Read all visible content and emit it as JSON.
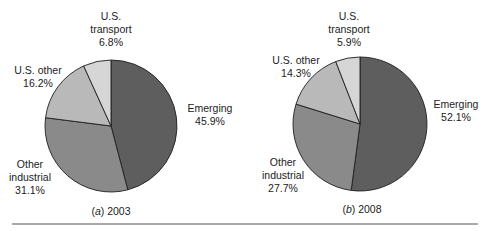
{
  "chart_data": [
    {
      "type": "pie",
      "title": "(a) 2003",
      "caption_prefix": "a",
      "caption_year": "2003",
      "categories": [
        "Emerging",
        "Other industrial",
        "U.S. other",
        "U.S. transport"
      ],
      "values": [
        45.9,
        31.1,
        16.2,
        6.8
      ],
      "labels": [
        "45.9%",
        "31.1%",
        "16.2%",
        "6.8%"
      ],
      "colors": [
        "#5e5e5e",
        "#8a8a8a",
        "#b9b9b9",
        "#d6d6d6"
      ],
      "start_angle": "12 o'clock, clockwise"
    },
    {
      "type": "pie",
      "title": "(b) 2008",
      "caption_prefix": "b",
      "caption_year": "2008",
      "categories": [
        "Emerging",
        "Other industrial",
        "U.S. other",
        "U.S. transport"
      ],
      "values": [
        52.1,
        27.7,
        14.3,
        5.9
      ],
      "labels": [
        "52.1%",
        "27.7%",
        "14.3%",
        "5.9%"
      ],
      "colors": [
        "#5e5e5e",
        "#8a8a8a",
        "#b9b9b9",
        "#d6d6d6"
      ],
      "start_angle": "12 o'clock, clockwise"
    }
  ],
  "charts": {
    "a": {
      "transport_l1": "U.S.",
      "transport_l2": "transport",
      "transport_pct": "6.8%",
      "other_l1": "U.S. other",
      "other_pct": "16.2%",
      "emerging_l1": "Emerging",
      "emerging_pct": "45.9%",
      "industrial_l1": "Other",
      "industrial_l2": "industrial",
      "industrial_pct": "31.1%",
      "caption_open": "(",
      "caption_letter": "a",
      "caption_rest": ") 2003"
    },
    "b": {
      "transport_l1": "U.S.",
      "transport_l2": "transport",
      "transport_pct": "5.9%",
      "other_l1": "U.S. other",
      "other_pct": "14.3%",
      "emerging_l1": "Emerging",
      "emerging_pct": "52.1%",
      "industrial_l1": "Other",
      "industrial_l2": "industrial",
      "industrial_pct": "27.7%",
      "caption_open": "(",
      "caption_letter": "b",
      "caption_rest": ") 2008"
    }
  }
}
